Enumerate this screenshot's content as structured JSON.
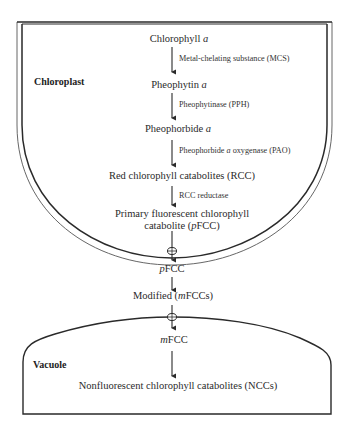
{
  "compartments": {
    "chloroplast": "Chloroplast",
    "vacuole": "Vacuole"
  },
  "nodes": {
    "n1_main": "Chlorophyll ",
    "n1_ital": "a",
    "n2_main": "Pheophytin ",
    "n2_ital": "a",
    "n3_main": "Pheophorbide ",
    "n3_ital": "a",
    "n4": "Red chlorophyll catabolites (RCC)",
    "n5_line1": "Primary fluorescent chlorophyll",
    "n5_line2_pre": "catabolite (",
    "n5_line2_ital": "p",
    "n5_line2_post": "FCC)",
    "n6_ital": "p",
    "n6_main": "FCC",
    "n7_pre": "Modified (",
    "n7_ital": "m",
    "n7_post": "FCCs)",
    "n8_ital": "m",
    "n8_main": "FCC",
    "n9": "Nonfluorescent chlorophyll catabolites (NCCs)"
  },
  "enzymes": {
    "e1": "Metal-chelating substance (MCS)",
    "e2": "Pheophytinase (PPH)",
    "e3_pre": "Pheophorbide ",
    "e3_ital": "a",
    "e3_post": " oxygenase (PAO)",
    "e4": "RCC reductase"
  },
  "colors": {
    "line": "#2a2a2a",
    "text": "#2a2a2a",
    "background": "#ffffff"
  }
}
